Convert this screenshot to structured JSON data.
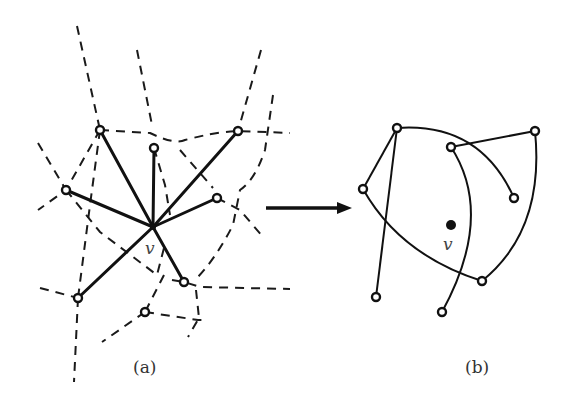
{
  "figure": {
    "panel_a": {
      "caption": "(a)",
      "center_label": "v",
      "description": "Star graph centered at v with dashed Voronoi-like cell boundaries"
    },
    "arrow": {
      "direction": "right"
    },
    "panel_b": {
      "caption": "(b)",
      "center_label": "v",
      "description": "Resulting curved-edge drawing with v as a filled point"
    }
  }
}
